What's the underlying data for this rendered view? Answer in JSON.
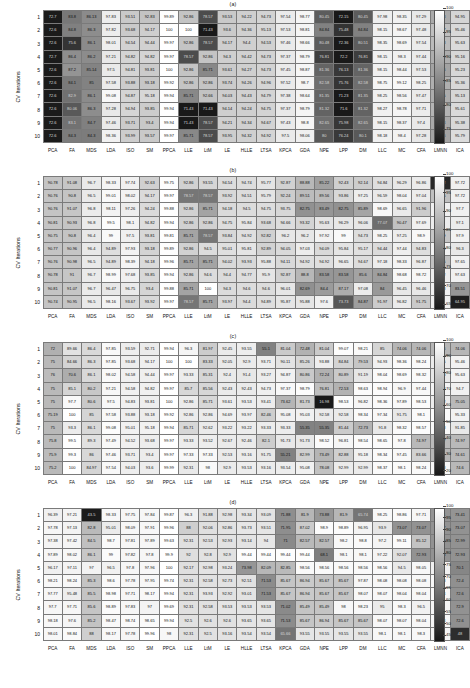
{
  "figure": {
    "ylabel": "CV Iterations",
    "row_labels": [
      "1",
      "2",
      "3",
      "4",
      "5",
      "6",
      "7",
      "8",
      "9",
      "10"
    ],
    "col_labels": [
      "PCA",
      "FA",
      "MDS",
      "LDA",
      "ISO",
      "SM",
      "PPCA",
      "LLE",
      "LtM",
      "LE",
      "HLLE",
      "LTSA",
      "KPCA",
      "GDA",
      "NPE",
      "LPP",
      "DM",
      "LLC",
      "MC",
      "CFA",
      "LMNN",
      "ICA"
    ]
  },
  "chart_data": [
    {
      "type": "heatmap",
      "title": "(a)",
      "xlabel": "",
      "ylabel": "CV Iterations",
      "x": [
        "PCA",
        "FA",
        "MDS",
        "LDA",
        "ISO",
        "SM",
        "PPCA",
        "LLE",
        "LtM",
        "LE",
        "HLLE",
        "LTSA",
        "KPCA",
        "GDA",
        "NPE",
        "LPP",
        "DM",
        "LLC",
        "MC",
        "CFA",
        "LMNN",
        "ICA"
      ],
      "y": [
        "1",
        "2",
        "3",
        "4",
        "5",
        "6",
        "7",
        "8",
        "9",
        "10"
      ],
      "colorbar_ticks": [
        100,
        95,
        90,
        85,
        80,
        75
      ],
      "zlim": [
        72.4,
        100
      ],
      "values": [
        [
          72.7,
          83.8,
          86.13,
          97.83,
          93.51,
          92.83,
          99.89,
          92.86,
          78.57,
          93.53,
          94.22,
          94.73,
          97.54,
          98.77,
          80.45,
          72.15,
          80.45,
          97.98,
          98.35,
          97.29,
          89.83,
          94.95
        ],
        [
          72.6,
          84.8,
          86.3,
          97.82,
          93.68,
          94.17,
          100,
          100,
          71.43,
          93.6,
          94.36,
          95.13,
          97.53,
          98.81,
          84.84,
          75.48,
          84.84,
          98.15,
          98.67,
          97.48,
          92.27,
          95.46
        ],
        [
          72.6,
          75.6,
          86.1,
          98.01,
          94.54,
          94.44,
          99.97,
          92.86,
          78.57,
          94.17,
          94.4,
          94.53,
          97.46,
          98.66,
          80.48,
          72.36,
          80.51,
          98.35,
          98.69,
          97.54,
          91.83,
          95.63
        ],
        [
          72.7,
          86.4,
          86.2,
          97.21,
          94.82,
          94.82,
          99.97,
          78.57,
          92.86,
          94.3,
          94.42,
          94.73,
          97.37,
          98.79,
          76.81,
          72.2,
          76.81,
          98.15,
          98.3,
          97.44,
          90.26,
          95.16
        ],
        [
          72.6,
          87.2,
          85.14,
          97.5,
          94.81,
          93.81,
          100,
          92.86,
          85.71,
          93.61,
          94.27,
          94.73,
          97.45,
          98.87,
          81.36,
          76.13,
          81.36,
          98.15,
          98.44,
          97.53,
          88.96,
          95.23
        ],
        [
          72.6,
          84.1,
          85.0,
          97.58,
          93.88,
          93.18,
          99.92,
          92.86,
          92.86,
          93.74,
          94.26,
          94.96,
          97.52,
          98.7,
          82.58,
          75.76,
          82.58,
          98.75,
          99.12,
          98.25,
          90.37,
          95.36
        ],
        [
          72.6,
          82.9,
          86.1,
          99.08,
          94.87,
          95.18,
          99.94,
          85.71,
          92.66,
          94.03,
          94.43,
          94.79,
          97.38,
          98.64,
          81.35,
          71.23,
          81.35,
          98.25,
          98.56,
          97.47,
          90.05,
          95.13
        ],
        [
          72.6,
          80.06,
          86.3,
          97.28,
          94.94,
          93.85,
          99.94,
          71.43,
          71.43,
          94.14,
          94.24,
          94.75,
          97.37,
          98.79,
          81.32,
          71.6,
          81.32,
          98.27,
          98.78,
          97.71,
          91.0,
          95.61
        ],
        [
          72.6,
          83.1,
          84.7,
          97.46,
          93.71,
          93.4,
          99.94,
          71.43,
          78.57,
          94.21,
          94.34,
          94.67,
          97.43,
          98.8,
          82.65,
          75.98,
          82.65,
          98.15,
          98.37,
          97.4,
          89.84,
          95.38
        ],
        [
          72.6,
          84.3,
          84.3,
          98.36,
          93.99,
          93.57,
          99.97,
          85.71,
          78.57,
          93.95,
          94.32,
          94.92,
          97.5,
          98.06,
          80.0,
          76.24,
          80.1,
          98.18,
          98.4,
          97.28,
          89.06,
          95.79
        ]
      ]
    },
    {
      "type": "heatmap",
      "title": "(b)",
      "xlabel": "",
      "ylabel": "CV Iterations",
      "x": [
        "PCA",
        "FA",
        "MDS",
        "LDA",
        "ISO",
        "SM",
        "PPCA",
        "LLE",
        "LtM",
        "LE",
        "HLLE",
        "LTSA",
        "KPCA",
        "GDA",
        "NPE",
        "LPP",
        "DM",
        "LLC",
        "MC",
        "CFA",
        "LMNN",
        "ICA"
      ],
      "y": [
        "1",
        "2",
        "3",
        "4",
        "5",
        "6",
        "7",
        "8",
        "9",
        "10"
      ],
      "colorbar_ticks": [
        100,
        95,
        90,
        85,
        80,
        75,
        70,
        65
      ],
      "zlim": [
        64.0,
        100
      ],
      "values": [
        [
          90.78,
          91.08,
          96.7,
          98.33,
          97.74,
          92.63,
          99.75,
          92.86,
          93.55,
          94.54,
          94.74,
          95.77,
          92.87,
          88.88,
          85.22,
          92.43,
          92.14,
          94.84,
          96.29,
          96.86,
          66.42,
          97.72
        ],
        [
          90.76,
          90.8,
          96.5,
          99.01,
          98.02,
          94.17,
          99.97,
          78.57,
          78.57,
          93.92,
          94.51,
          95.79,
          92.24,
          89.51,
          89.56,
          93.86,
          97.25,
          96.59,
          98.04,
          97.04,
          90.15,
          97.72
        ],
        [
          90.76,
          91.07,
          96.8,
          98.11,
          97.26,
          94.24,
          99.88,
          92.86,
          85.71,
          94.18,
          94.5,
          94.75,
          93.75,
          82.75,
          83.49,
          82.75,
          85.89,
          98.69,
          96.65,
          91.96,
          97.7,
          97.7
        ],
        [
          90.81,
          90.93,
          96.8,
          99.5,
          98.1,
          94.82,
          99.94,
          92.86,
          92.86,
          94.75,
          95.84,
          93.68,
          94.66,
          93.32,
          95.63,
          96.29,
          96.06,
          77.07,
          90.47,
          97.69,
          97.1,
          97.1
        ],
        [
          90.75,
          90.8,
          96.4,
          99.0,
          97.5,
          93.81,
          99.81,
          85.71,
          78.57,
          93.84,
          94.92,
          92.82,
          96.2,
          96.2,
          97.92,
          99.0,
          94.73,
          98.25,
          97.25,
          98.9,
          91.09,
          97.9
        ],
        [
          90.77,
          90.96,
          96.4,
          94.89,
          97.93,
          93.18,
          99.89,
          92.86,
          94.5,
          95.01,
          95.81,
          92.89,
          94.05,
          97.03,
          94.09,
          95.84,
          95.17,
          94.44,
          97.44,
          94.83,
          97.88,
          96.3
        ],
        [
          90.76,
          90.98,
          96.5,
          94.89,
          98.39,
          94.18,
          99.96,
          85.71,
          85.71,
          94.02,
          93.93,
          95.88,
          94.11,
          94.92,
          94.92,
          96.65,
          94.67,
          97.18,
          98.33,
          96.87,
          90.15,
          97.65
        ],
        [
          90.78,
          91.0,
          96.7,
          98.99,
          97.68,
          93.85,
          99.94,
          92.86,
          94.6,
          94.4,
          94.77,
          95.9,
          92.87,
          88.8,
          83.58,
          83.58,
          85.6,
          84.84,
          98.68,
          98.72,
          97.12,
          97.63
        ],
        [
          90.81,
          91.07,
          96.7,
          96.47,
          96.75,
          93.4,
          99.88,
          85.71,
          100,
          94.3,
          94.6,
          94.6,
          96.01,
          82.69,
          84.4,
          87.17,
          97.08,
          84.0,
          96.45,
          96.46,
          97.78,
          83.51,
          97.65
        ],
        [
          90.74,
          90.95,
          96.5,
          98.16,
          93.67,
          93.92,
          99.97,
          78.57,
          85.71,
          93.97,
          94.4,
          94.89,
          95.87,
          95.88,
          97.6,
          73.73,
          84.87,
          91.97,
          96.82,
          91.75,
          97.7,
          64.95
        ]
      ]
    },
    {
      "type": "heatmap",
      "title": "(c)",
      "xlabel": "",
      "ylabel": "CV Iterations",
      "x": [
        "PCA",
        "FA",
        "MDS",
        "LDA",
        "ISO",
        "SM",
        "PPCA",
        "LLE",
        "LtM",
        "LE",
        "HLLE",
        "LTSA",
        "KPCA",
        "GDA",
        "NPE",
        "LPP",
        "DM",
        "LLC",
        "MC",
        "CFA",
        "LMNN",
        "ICA"
      ],
      "y": [
        "1",
        "2",
        "3",
        "4",
        "5",
        "6",
        "7",
        "8",
        "9",
        "10"
      ],
      "colorbar_ticks": [
        100,
        90,
        80,
        70,
        60,
        50,
        40,
        30,
        20
      ],
      "zlim": [
        18.0,
        100
      ],
      "values": [
        [
          72.0,
          89.66,
          86.4,
          97.85,
          93.59,
          92.71,
          99.94,
          96.3,
          81.97,
          92.45,
          93.55,
          55.1,
          81.04,
          72.48,
          81.04,
          99.07,
          98.21,
          85.0,
          74.06,
          74.06,
          74.06,
          74.06
        ],
        [
          75.0,
          84.66,
          86.3,
          97.85,
          93.68,
          94.17,
          100,
          100,
          83.33,
          92.05,
          92.9,
          93.71,
          90.11,
          85.26,
          93.88,
          84.84,
          79.53,
          94.93,
          98.36,
          98.24,
          92.85,
          95.46
        ],
        [
          76.0,
          70.6,
          86.1,
          98.02,
          94.58,
          94.44,
          99.97,
          93.33,
          85.31,
          92.4,
          91.4,
          93.27,
          94.87,
          80.86,
          72.24,
          80.89,
          91.19,
          98.04,
          98.69,
          98.32,
          91.88,
          95.63
        ],
        [
          75.0,
          85.1,
          80.2,
          97.21,
          94.58,
          94.82,
          99.97,
          85.7,
          85.56,
          92.43,
          92.43,
          94.73,
          97.37,
          98.79,
          76.81,
          72.53,
          98.63,
          98.94,
          96.9,
          97.44,
          96.03,
          94.7
        ],
        [
          75.0,
          97.7,
          80.6,
          97.5,
          94.83,
          93.81,
          100,
          92.86,
          85.71,
          93.61,
          93.53,
          93.41,
          73.62,
          81.73,
          16.98,
          98.53,
          96.82,
          98.36,
          97.89,
          98.53,
          93.22,
          75.05
        ],
        [
          75.19,
          100,
          85.0,
          97.58,
          93.88,
          93.18,
          99.92,
          92.86,
          92.86,
          94.69,
          93.97,
          82.46,
          95.08,
          95.03,
          92.58,
          92.58,
          98.34,
          97.34,
          91.75,
          98.1,
          98.4,
          95.33
        ],
        [
          75.0,
          93.3,
          86.1,
          99.08,
          95.01,
          95.18,
          99.94,
          85.71,
          92.62,
          93.22,
          93.22,
          93.33,
          93.33,
          55.35,
          55.35,
          81.44,
          72.73,
          91.8,
          98.32,
          98.57,
          97.48,
          91.85,
          74.61
        ],
        [
          75.8,
          99.5,
          89.3,
          97.49,
          94.52,
          93.68,
          99.97,
          93.33,
          93.52,
          92.67,
          92.46,
          82.1,
          91.73,
          91.73,
          98.52,
          96.81,
          98.54,
          98.65,
          97.8,
          74.97,
          74.97,
          74.97
        ],
        [
          75.9,
          99.3,
          86.0,
          97.46,
          93.71,
          93.4,
          99.97,
          97.33,
          97.33,
          92.53,
          93.16,
          91.75,
          55.21,
          82.99,
          73.49,
          82.88,
          95.18,
          98.34,
          97.45,
          83.66,
          74.1,
          74.61
        ],
        [
          75.2,
          100.0,
          84.97,
          97.54,
          94.03,
          93.6,
          99.99,
          92.31,
          98.0,
          92.9,
          93.53,
          93.16,
          93.54,
          95.08,
          78.08,
          92.99,
          92.99,
          98.37,
          98.1,
          98.24,
          96.98,
          74.6
        ]
      ]
    },
    {
      "type": "heatmap",
      "title": "(d)",
      "xlabel": "",
      "ylabel": "CV Iterations",
      "x": [
        "PCA",
        "FA",
        "MDS",
        "LDA",
        "ISO",
        "SM",
        "PPCA",
        "LLE",
        "LtM",
        "LE",
        "HLLE",
        "LTSA",
        "KPCA",
        "GDA",
        "NPE",
        "LPP",
        "DM",
        "LLC",
        "MC",
        "CFA",
        "LMNN",
        "ICA"
      ],
      "y": [
        "1",
        "2",
        "3",
        "4",
        "5",
        "6",
        "7",
        "8",
        "9",
        "10"
      ],
      "colorbar_ticks": [
        100,
        95,
        90,
        85,
        80,
        75,
        70,
        65,
        60,
        55,
        50,
        45
      ],
      "zlim": [
        43.0,
        100
      ],
      "values": [
        [
          96.39,
          97.21,
          43.5,
          98.33,
          97.75,
          97.84,
          99.87,
          96.3,
          91.88,
          92.98,
          93.34,
          93.09,
          71.88,
          81.9,
          73.88,
          81.9,
          65.74,
          98.25,
          98.86,
          97.71,
          73.41,
          73.41
        ],
        [
          97.78,
          97.13,
          82.8,
          95.01,
          98.09,
          97.91,
          99.96,
          88.0,
          92.06,
          92.86,
          93.73,
          93.51,
          71.95,
          87.02,
          98.9,
          98.89,
          96.95,
          93.9,
          73.07,
          73.07,
          73.07,
          73.07
        ],
        [
          97.38,
          97.42,
          84.5,
          98.7,
          97.81,
          97.89,
          99.63,
          92.31,
          92.53,
          92.93,
          93.14,
          94.0,
          71.0,
          82.57,
          82.57,
          98.2,
          98.8,
          97.2,
          99.11,
          85.12,
          72.99,
          72.99
        ],
        [
          97.89,
          98.02,
          86.1,
          99.0,
          97.82,
          97.8,
          99.9,
          92.0,
          92.8,
          92.9,
          99.44,
          99.44,
          99.44,
          99.44,
          68.1,
          98.1,
          98.1,
          97.22,
          92.07,
          72.93,
          72.93,
          72.93
        ],
        [
          96.17,
          97.11,
          97.0,
          96.5,
          97.8,
          97.96,
          100,
          92.17,
          92.98,
          93.24,
          73.98,
          82.09,
          82.85,
          98.56,
          98.56,
          98.56,
          98.56,
          98.56,
          94.5,
          98.05,
          96.3,
          70.1
        ],
        [
          98.21,
          98.24,
          85.3,
          98.6,
          97.78,
          97.95,
          99.74,
          92.31,
          92.58,
          92.73,
          92.51,
          71.53,
          85.67,
          86.94,
          85.67,
          85.67,
          97.87,
          98.08,
          98.08,
          98.08,
          98.08,
          72.4
        ],
        [
          97.77,
          95.48,
          85.5,
          98.98,
          97.71,
          98.17,
          99.94,
          92.31,
          93.93,
          92.92,
          93.01,
          71.53,
          85.67,
          86.94,
          85.67,
          85.67,
          98.07,
          98.07,
          98.04,
          98.04,
          98.04,
          72.6
        ],
        [
          97.7,
          97.71,
          85.6,
          98.89,
          97.83,
          97.0,
          99.69,
          92.31,
          92.58,
          93.53,
          93.53,
          93.53,
          71.02,
          85.49,
          85.49,
          98.0,
          98.23,
          95.0,
          98.3,
          96.5,
          97.5,
          72.9
        ],
        [
          98.18,
          97.6,
          85.2,
          98.47,
          98.74,
          98.65,
          99.94,
          92.5,
          92.6,
          92.6,
          93.65,
          93.65,
          71.53,
          85.67,
          86.94,
          85.67,
          85.67,
          98.07,
          98.07,
          98.04,
          98.04,
          72.6
        ],
        [
          98.01,
          98.84,
          88.0,
          98.17,
          97.78,
          99.96,
          98.0,
          92.31,
          92.5,
          93.16,
          93.54,
          93.54,
          65.66,
          93.55,
          93.55,
          93.55,
          93.55,
          98.1,
          98.1,
          98.3,
          97.5,
          48.0
        ]
      ]
    }
  ]
}
